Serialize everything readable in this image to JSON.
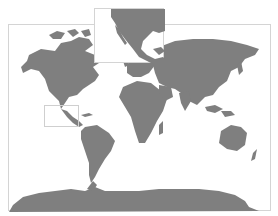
{
  "map": {
    "type": "world-map",
    "projection": "Mercator",
    "land_color": "#7f7f7f",
    "water_color": "#ffffff",
    "frame_color": "#d4d4d4",
    "main_frame": {
      "x": 8,
      "y": 24,
      "width": 263,
      "height": 187
    },
    "inset": {
      "region": "Mexico and Central America",
      "frame": {
        "x": 94,
        "y": 8,
        "width": 70,
        "height": 55
      },
      "extent_box_on_main": {
        "x": 35,
        "y": 80,
        "width": 35,
        "height": 22
      }
    },
    "regions_shown": [
      "North America",
      "Greenland",
      "South America",
      "Europe",
      "Africa",
      "Asia",
      "Australia",
      "Antarctica",
      "Mexico inset"
    ]
  }
}
